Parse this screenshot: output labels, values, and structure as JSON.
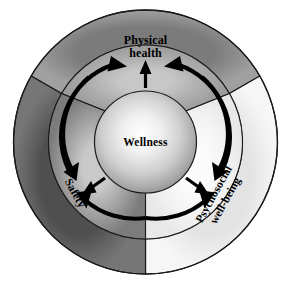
{
  "diagram": {
    "title": "Wellness",
    "center": {
      "label": "Wellness"
    },
    "sectors": [
      {
        "id": "physical-health",
        "label_line1": "Physical",
        "label_line2": "health",
        "position": "top",
        "outer_fill": "#8a8a8a",
        "middle_fill": "#a8a8a8"
      },
      {
        "id": "psychosocial-wellbeing",
        "label_line1": "Psychosocial",
        "label_line2": "well-being",
        "position": "right",
        "outer_fill": "#ececec",
        "middle_fill": "#f2f2f2"
      },
      {
        "id": "safety",
        "label_line1": "Safety",
        "label_line2": "",
        "position": "left",
        "outer_fill": "#5f5f5f",
        "middle_fill": "#8f8f8f"
      }
    ],
    "colors": {
      "background": "#ffffff",
      "stroke": "#1a1a1a",
      "arrow": "#000000",
      "center_highlight": "#ffffff",
      "center_edge": "#8e8e8e"
    },
    "arrows": {
      "radial_count": 3,
      "arc_count": 6,
      "direction": "outward-and-cyclical"
    }
  }
}
